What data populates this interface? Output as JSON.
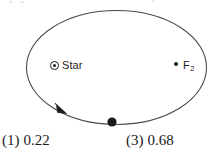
{
  "figure": {
    "name": "elliptical-orbit-diagram",
    "stroke_color": "#4a4a4a",
    "ink_color": "#1c1c1c",
    "background_color": "#ffffff"
  },
  "orbit": {
    "ellipse": {
      "cx": 116.5,
      "cy": 67.5,
      "rx": 90,
      "ry": 57
    },
    "direction_arrow": {
      "name": "orbit-direction-arrow",
      "tip_x": 64,
      "tip_y": 112,
      "direction": "clockwise"
    }
  },
  "markers": {
    "star": {
      "label": "Star",
      "icon": "circled-dot-icon",
      "x": 57,
      "y": 66
    },
    "focus2": {
      "label": "F",
      "subscript": "2",
      "icon": "filled-dot-icon",
      "x": 178,
      "y": 66
    },
    "planet": {
      "icon": "filled-planet-dot-icon",
      "x": 112,
      "y": 122,
      "radius": 4.6
    }
  },
  "options": [
    {
      "number": "(1)",
      "value": "0.22"
    },
    {
      "number": "(3)",
      "value": "0.68"
    }
  ]
}
